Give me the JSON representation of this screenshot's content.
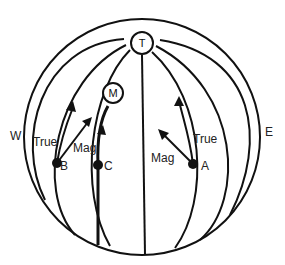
{
  "diagram": {
    "type": "globe-meridians",
    "title_visible": "",
    "poles": {
      "true_north": {
        "label": "T",
        "x": 142,
        "y": 43
      },
      "magnetic_north": {
        "label": "M",
        "x": 113,
        "y": 93
      }
    },
    "directions": {
      "west": "W",
      "east": "E"
    },
    "points": [
      {
        "id": "A",
        "label": "A",
        "x": 193,
        "y": 164,
        "true_label": "True",
        "mag_label": "Mag"
      },
      {
        "id": "B",
        "label": "B",
        "x": 57,
        "y": 163,
        "true_label": "True",
        "mag_label": "Mag"
      },
      {
        "id": "C",
        "label": "C",
        "x": 98,
        "y": 165
      }
    ],
    "colors": {
      "line": "#111111",
      "background": "#ffffff"
    }
  }
}
